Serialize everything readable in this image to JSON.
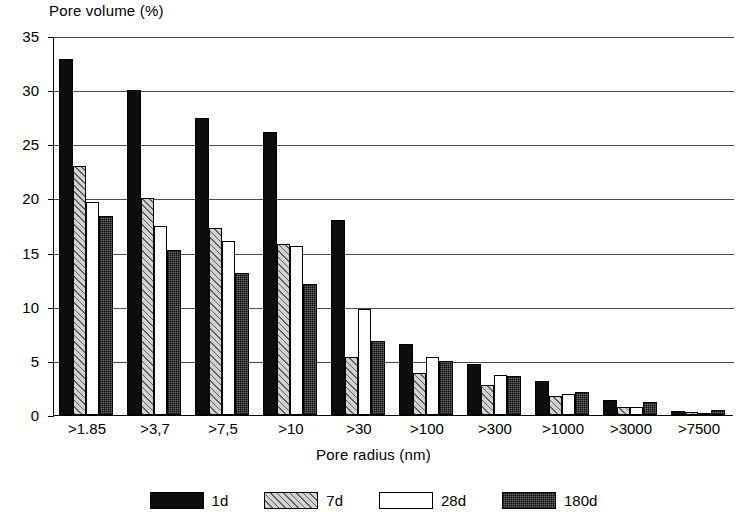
{
  "chart_data": {
    "type": "bar",
    "title": "",
    "ylabel": "Pore volume (%)",
    "xlabel": "Pore radius (nm)",
    "ylim": [
      0,
      35
    ],
    "yticks": [
      0,
      5,
      10,
      15,
      20,
      25,
      30,
      35
    ],
    "grid": true,
    "legend_position": "bottom",
    "categories": [
      ">1.85",
      ">3,7",
      ">7,5",
      ">10",
      ">30",
      ">100",
      ">300",
      ">1000",
      ">3000",
      ">7500"
    ],
    "series": [
      {
        "name": "1d",
        "color": "#0d0d0d",
        "pattern": "solid-black",
        "values": [
          32.9,
          30.0,
          27.4,
          26.1,
          18.0,
          6.6,
          4.7,
          3.1,
          1.4,
          0.35
        ]
      },
      {
        "name": "7d",
        "color": "#d2d2d2",
        "pattern": "diagonal-hatch",
        "values": [
          23.0,
          20.0,
          17.3,
          15.8,
          5.4,
          3.9,
          2.8,
          1.8,
          0.7,
          0.3
        ]
      },
      {
        "name": "28d",
        "color": "#ffffff",
        "pattern": "white",
        "values": [
          19.7,
          17.5,
          16.1,
          15.6,
          9.8,
          5.4,
          3.7,
          1.9,
          0.7,
          0.15
        ]
      },
      {
        "name": "180d",
        "color": "#6b6b6b",
        "pattern": "stipple",
        "values": [
          18.4,
          15.2,
          13.1,
          12.1,
          6.8,
          5.0,
          3.6,
          2.1,
          1.2,
          0.5
        ]
      }
    ]
  },
  "axis": {
    "y_title": "Pore volume (%)",
    "x_title": "Pore radius (nm)",
    "y_tick_labels": [
      "35",
      "30",
      "25",
      "20",
      "15",
      "10",
      "5",
      "0"
    ],
    "x_tick_labels": [
      ">1.85",
      ">3,7",
      ">7,5",
      ">10",
      ">30",
      ">100",
      ">300",
      ">1000",
      ">3000",
      ">7500"
    ]
  },
  "legend": {
    "items": [
      {
        "label": "1d"
      },
      {
        "label": "7d"
      },
      {
        "label": "28d"
      },
      {
        "label": "180d"
      }
    ]
  }
}
